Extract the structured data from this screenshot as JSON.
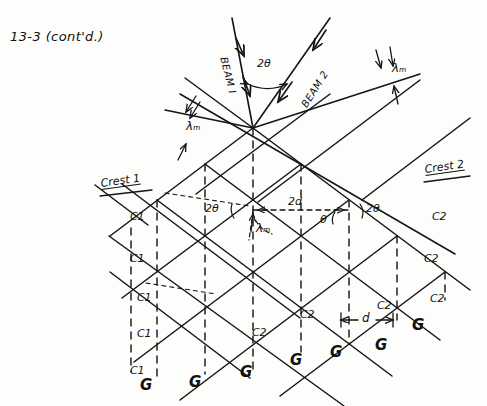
{
  "page": {
    "title": "13-3 (cont'd.)",
    "ink_color": "#141414",
    "paper_color": "#fdfdfc",
    "width": 487,
    "height": 406
  },
  "beams": {
    "beam1_label": "BEAM I",
    "beam2_label": "BEAM 2",
    "between_angle_label": "2θ"
  },
  "wavelength_labels": {
    "top_right": "λₘ",
    "upper_left": "λₘ",
    "center": "λₘ"
  },
  "crests": {
    "left_label": "Crest 1",
    "right_label": "Crest 2"
  },
  "angles": {
    "left_2theta": "2θ",
    "center_theta": "θ",
    "right_2theta": "2θ",
    "path_difference": "2d"
  },
  "spacing": {
    "d_label": "d"
  },
  "crest1_nodes": [
    {
      "label": "C1",
      "x": 130,
      "y": 211
    },
    {
      "label": "C1",
      "x": 130,
      "y": 253
    },
    {
      "label": "C1",
      "x": 137,
      "y": 292
    },
    {
      "label": "C1",
      "x": 137,
      "y": 328
    },
    {
      "label": "C1",
      "x": 130,
      "y": 365
    }
  ],
  "crest2_nodes": [
    {
      "label": "C2",
      "x": 432,
      "y": 211
    },
    {
      "label": "C2",
      "x": 424,
      "y": 253
    },
    {
      "label": "C2",
      "x": 430,
      "y": 293
    },
    {
      "label": "C2",
      "x": 377,
      "y": 300
    },
    {
      "label": "C2",
      "x": 300,
      "y": 309
    },
    {
      "label": "C2",
      "x": 252,
      "y": 327
    }
  ],
  "grid_nodes": [
    {
      "label": "G",
      "x": 140,
      "y": 378
    },
    {
      "label": "G",
      "x": 189,
      "y": 375
    },
    {
      "label": "G",
      "x": 240,
      "y": 365
    },
    {
      "label": "G",
      "x": 290,
      "y": 353
    },
    {
      "label": "G",
      "x": 330,
      "y": 345
    },
    {
      "label": "G",
      "x": 375,
      "y": 338
    },
    {
      "label": "G",
      "x": 412,
      "y": 318
    }
  ],
  "chart_data": {
    "type": "diagram",
    "title": "13-3 (cont'd.)",
    "lattice": {
      "apex": {
        "x": 253,
        "y": 128
      },
      "step_x": 48,
      "step_y": 36,
      "rows": 7,
      "cols": 7,
      "line_families": [
        "down-right",
        "down-left",
        "vertical-dashed"
      ]
    }
  }
}
